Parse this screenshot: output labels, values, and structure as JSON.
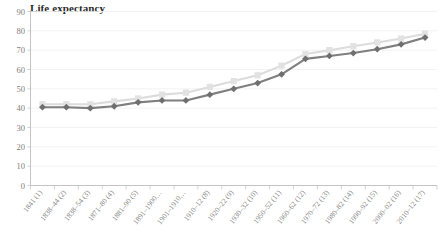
{
  "chart_data": {
    "type": "line",
    "title": "Life expectancy",
    "xlabel": "",
    "ylabel": "",
    "ylim": [
      0,
      90
    ],
    "yticks": [
      0,
      10,
      20,
      30,
      40,
      50,
      60,
      70,
      80,
      90
    ],
    "grid": true,
    "legend": "none",
    "categories": [
      "1841 (1)",
      "1838–44 (2)",
      "1838–54 (3)",
      "1871–80 (4)",
      "1881–90 (5)",
      "1891–1900…",
      "1901–1910…",
      "1910–12 (8)",
      "1920–22 (9)",
      "1930–32 (10)",
      "1950–52 (11)",
      "1960–62 (12)",
      "1970–72 (13)",
      "1980–82 (14)",
      "1990–92 (15)",
      "2000–02 (16)",
      "2010–12 (17)"
    ],
    "series": [
      {
        "name": "upper-series",
        "color": "#dcdcdc",
        "marker": "square",
        "values": [
          42.0,
          42.0,
          42.0,
          43.5,
          45.0,
          47.0,
          48.0,
          51.0,
          54.0,
          57.0,
          62.0,
          68.0,
          70.0,
          72.0,
          74.0,
          76.0,
          78.5
        ]
      },
      {
        "name": "lower-series",
        "color": "#7f7f7f",
        "marker": "diamond",
        "values": [
          40.5,
          40.5,
          40.0,
          41.0,
          43.0,
          44.0,
          44.0,
          47.0,
          50.0,
          53.0,
          57.5,
          65.5,
          67.0,
          68.5,
          70.5,
          73.0,
          76.5
        ]
      }
    ],
    "colors": {
      "light_series": "#dcdcdc",
      "dark_series": "#7f7f7f",
      "gridline": "#efefef",
      "axis": "#bdbdbd",
      "tick_text": "#808080",
      "title_text": "#2b2b2b",
      "background": "#ffffff"
    }
  }
}
